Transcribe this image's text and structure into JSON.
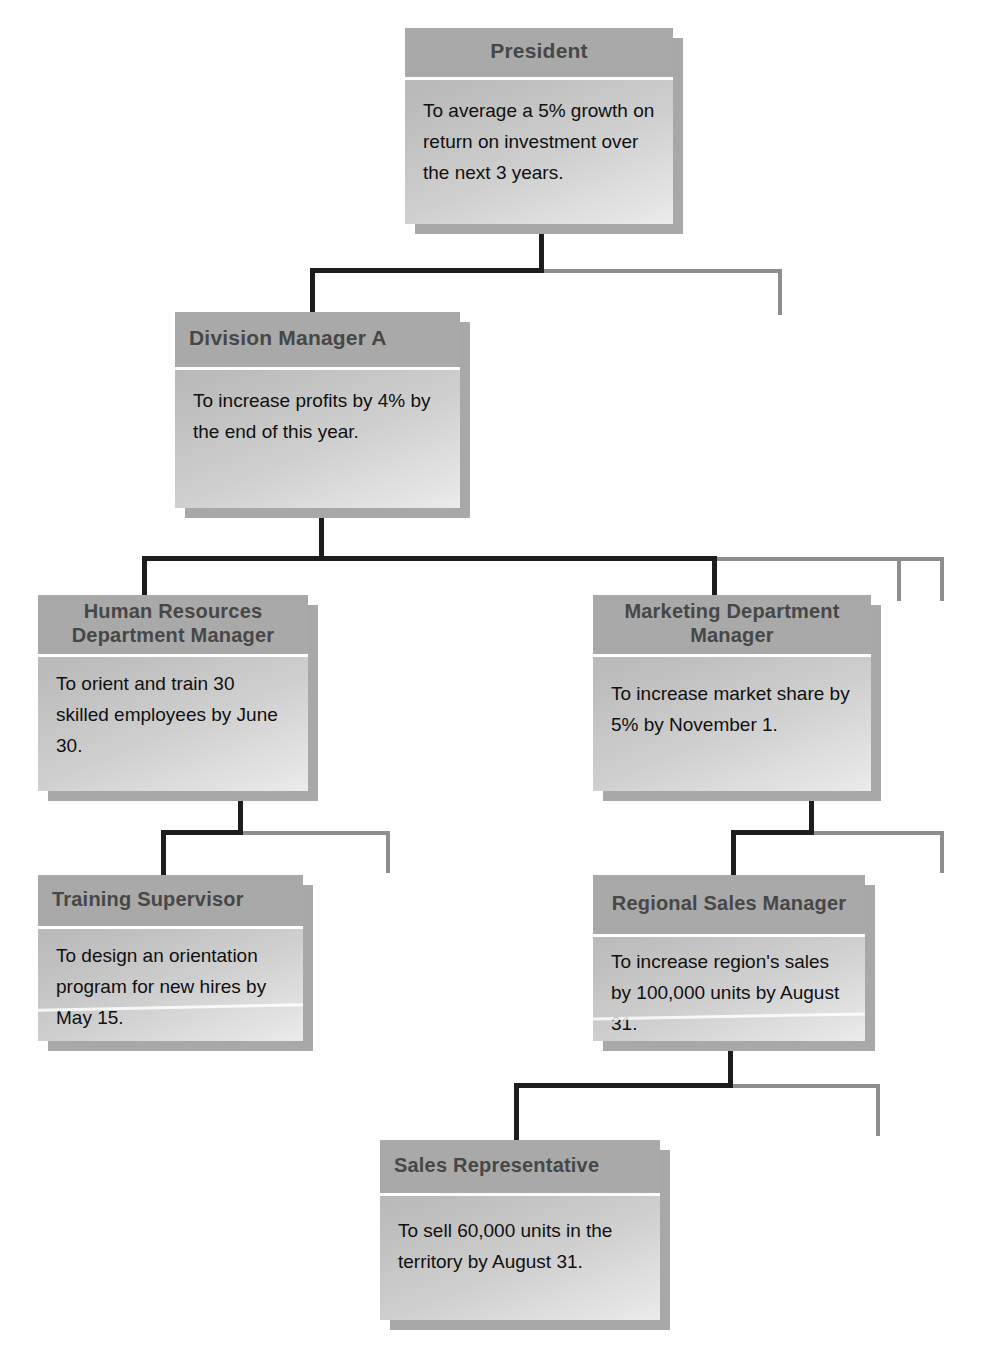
{
  "chart": {
    "type": "org-chart",
    "accent_dark": "#1d1d1d",
    "accent_light": "#8e8e8e",
    "node_header_color": "#a9a9a9",
    "node_body_color": "#cfcfcf",
    "shadow_color": "#a8a8a8"
  },
  "nodes": {
    "president": {
      "title": "President",
      "objective": "To average a 5% growth on return on investment over the next 3 years.",
      "level": 1
    },
    "division_a": {
      "title": "Division Manager A",
      "objective": "To increase profits by 4% by the end of this year.",
      "level": 2
    },
    "human_resources": {
      "title": "Human Resources Department Manager",
      "objective": "To orient and train 30 skilled employees by June 30.",
      "level": 3
    },
    "marketing": {
      "title": "Marketing Department Manager",
      "objective": "To increase market share by 5% by November 1.",
      "level": 3
    },
    "training_supervisor": {
      "title": "Training Supervisor",
      "objective": "To design an orientation program for new hires by May 15.",
      "level": 4
    },
    "regional_sales": {
      "title": "Regional Sales Manager",
      "objective": "To increase region's sales by 100,000 units by August 31.",
      "level": 4
    },
    "sales_representative": {
      "title": "Sales Representative",
      "objective": "To sell 60,000 units in the territory by August 31.",
      "level": 5
    }
  },
  "connectors": [
    {
      "name": "president-to-division-a",
      "from": "president",
      "to": "division_a",
      "style": "solid-dark"
    },
    {
      "name": "president-to-unfilled-sibling",
      "from": "president",
      "to": null,
      "style": "solid-light"
    },
    {
      "name": "division-a-to-human-resources",
      "from": "division_a",
      "to": "human_resources",
      "style": "solid-dark"
    },
    {
      "name": "division-a-to-marketing",
      "from": "division_a",
      "to": "marketing",
      "style": "solid-dark"
    },
    {
      "name": "division-a-to-unfilled-sibling-1",
      "from": "division_a",
      "to": null,
      "style": "solid-light"
    },
    {
      "name": "division-a-to-unfilled-sibling-2",
      "from": "division_a",
      "to": null,
      "style": "solid-light"
    },
    {
      "name": "human-resources-to-training-supervisor",
      "from": "human_resources",
      "to": "training_supervisor",
      "style": "solid-dark"
    },
    {
      "name": "human-resources-to-unfilled-sibling",
      "from": "human_resources",
      "to": null,
      "style": "solid-light"
    },
    {
      "name": "marketing-to-regional-sales",
      "from": "marketing",
      "to": "regional_sales",
      "style": "solid-dark"
    },
    {
      "name": "marketing-to-unfilled-sibling",
      "from": "marketing",
      "to": null,
      "style": "solid-light"
    },
    {
      "name": "regional-sales-to-sales-representative",
      "from": "regional_sales",
      "to": "sales_representative",
      "style": "solid-dark"
    },
    {
      "name": "regional-sales-to-unfilled-sibling",
      "from": "regional_sales",
      "to": null,
      "style": "solid-light"
    }
  ]
}
